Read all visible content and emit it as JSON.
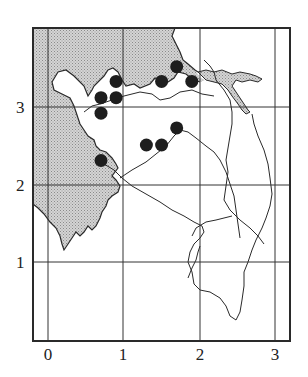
{
  "map": {
    "frame": {
      "left": 33,
      "top": 28,
      "right": 290,
      "bottom": 341
    },
    "colors": {
      "land_shade": "#c9c9c9",
      "line": "#2a2a2a",
      "dot": "#1e1e1e",
      "grid": "#333333",
      "background": "#ffffff"
    },
    "x_axis": {
      "ticks": [
        {
          "label": "0",
          "px": 48
        },
        {
          "label": "1",
          "px": 123
        },
        {
          "label": "2",
          "px": 200
        },
        {
          "label": "3",
          "px": 275
        }
      ]
    },
    "y_axis": {
      "ticks": [
        {
          "label": "3",
          "px": 107
        },
        {
          "label": "2",
          "px": 185
        },
        {
          "label": "1",
          "px": 262
        }
      ]
    },
    "points": [
      {
        "x": 0.9,
        "y": 3.33
      },
      {
        "x": 0.7,
        "y": 3.12
      },
      {
        "x": 0.9,
        "y": 3.12
      },
      {
        "x": 0.7,
        "y": 2.92
      },
      {
        "x": 1.5,
        "y": 3.33
      },
      {
        "x": 1.7,
        "y": 3.52
      },
      {
        "x": 1.9,
        "y": 3.33
      },
      {
        "x": 1.3,
        "y": 2.51
      },
      {
        "x": 1.5,
        "y": 2.51
      },
      {
        "x": 1.7,
        "y": 2.73
      },
      {
        "x": 0.7,
        "y": 2.31
      }
    ]
  }
}
